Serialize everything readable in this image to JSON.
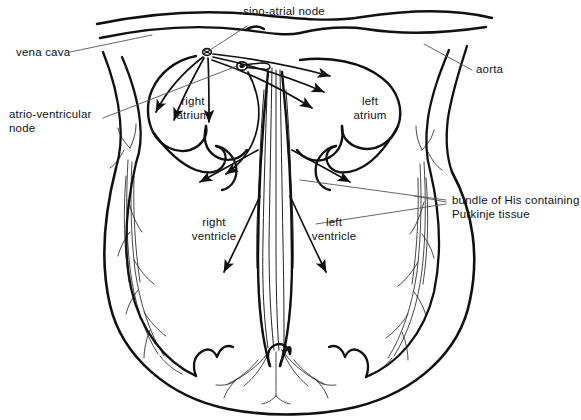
{
  "diagram": {
    "background_color": "#ffffff",
    "ink_color": "#111111",
    "leader_color": "#555555"
  },
  "labels": {
    "sino_atrial_node": "sino-atrial node",
    "vena_cava": "vena cava",
    "atrio_ventricular_node_line1": "atrio-ventricular",
    "atrio_ventricular_node_line2": "node",
    "aorta": "aorta",
    "right_atrium_line1": "right",
    "right_atrium_line2": "atrium",
    "left_atrium_line1": "left",
    "left_atrium_line2": "atrium",
    "right_ventricle_line1": "right",
    "right_ventricle_line2": "ventricle",
    "left_ventricle_line1": "left",
    "left_ventricle_line2": "ventricle",
    "bundle_of_his_line1": "bundle of His containing",
    "bundle_of_his_line2": "Purkinje tissue"
  },
  "markers": {
    "sino_atrial_node": {
      "x": 207,
      "y": 52
    },
    "atrio_ventricular_node": {
      "x": 242,
      "y": 66
    }
  }
}
